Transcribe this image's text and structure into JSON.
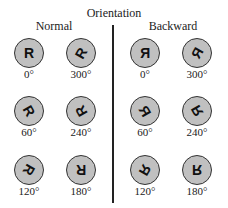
{
  "title": "Orientation",
  "groups": {
    "normal": {
      "label": "Normal",
      "items": [
        {
          "glyph": "R",
          "angle_label": "0°",
          "rotation": 0,
          "mirrored": false
        },
        {
          "glyph": "R",
          "angle_label": "300°",
          "rotation": 300,
          "mirrored": false
        },
        {
          "glyph": "R",
          "angle_label": "60°",
          "rotation": 60,
          "mirrored": false
        },
        {
          "glyph": "R",
          "angle_label": "240°",
          "rotation": 240,
          "mirrored": false
        },
        {
          "glyph": "R",
          "angle_label": "120°",
          "rotation": 120,
          "mirrored": false
        },
        {
          "glyph": "R",
          "angle_label": "180°",
          "rotation": 180,
          "mirrored": false
        }
      ]
    },
    "backward": {
      "label": "Backward",
      "items": [
        {
          "glyph": "R",
          "angle_label": "0°",
          "rotation": 0,
          "mirrored": true
        },
        {
          "glyph": "R",
          "angle_label": "300°",
          "rotation": 300,
          "mirrored": true
        },
        {
          "glyph": "R",
          "angle_label": "60°",
          "rotation": 60,
          "mirrored": true
        },
        {
          "glyph": "R",
          "angle_label": "240°",
          "rotation": 240,
          "mirrored": true
        },
        {
          "glyph": "R",
          "angle_label": "120°",
          "rotation": 120,
          "mirrored": true
        },
        {
          "glyph": "R",
          "angle_label": "180°",
          "rotation": 180,
          "mirrored": true
        }
      ]
    }
  },
  "colors": {
    "disc_fill": "#c0c0c0",
    "disc_stroke": "#333333",
    "divider": "#222222"
  }
}
